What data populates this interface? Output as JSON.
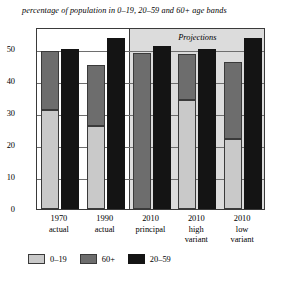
{
  "chart_data": {
    "type": "bar",
    "title": "percentage of population in 0–19, 20–59 and 60+ age bands",
    "xlabel": "",
    "ylabel": "",
    "ylim": [
      0,
      57
    ],
    "yticks": [
      0,
      10,
      20,
      30,
      40,
      50
    ],
    "grid": true,
    "legend_position": "bottom-left",
    "categories": [
      "1970 actual",
      "1990 actual",
      "2010 principal",
      "2010 high variant",
      "2010 low variant"
    ],
    "category_lines": [
      [
        "1970",
        "actual",
        ""
      ],
      [
        "1990",
        "actual",
        ""
      ],
      [
        "2010",
        "principal",
        ""
      ],
      [
        "2010",
        "high",
        "variant"
      ],
      [
        "2010",
        "low",
        "variant"
      ]
    ],
    "series": [
      {
        "name": "0–19",
        "color": "#c9c9c9",
        "stacked_with": "60+",
        "values": [
          31,
          26,
          0,
          34,
          22
        ]
      },
      {
        "name": "60+",
        "color": "#6d6d6d",
        "stacked_top": true,
        "values": [
          18.5,
          19,
          49,
          14.5,
          24
        ]
      },
      {
        "name": "20–59",
        "color": "#141414",
        "stacked_with": null,
        "values": [
          50,
          53.5,
          51,
          50,
          53.5
        ]
      }
    ],
    "stacked_totals": [
      49.5,
      45,
      49,
      48.5,
      46
    ],
    "annotations": [
      {
        "text": "Projections",
        "style": "italic",
        "region_start_category": "2010 principal"
      }
    ]
  },
  "legend": {
    "items": [
      {
        "label": "0–19",
        "color": "#c9c9c9"
      },
      {
        "label": "60+",
        "color": "#6d6d6d"
      },
      {
        "label": "20–59",
        "color": "#141414"
      }
    ]
  },
  "colors": {
    "band_0019": "#c9c9c9",
    "band_60plus": "#6d6d6d",
    "band_2059": "#141414",
    "projection_background": "#dcdcdc",
    "axis": "#3a3a3a",
    "gridline": "#6e6e6e"
  }
}
